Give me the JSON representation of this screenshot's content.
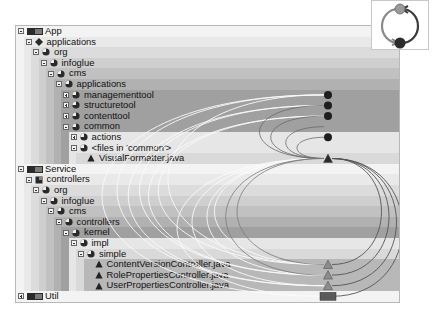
{
  "view": {
    "title": "Dependency structure view",
    "legend_icon": "cyclic-dependency-icon"
  },
  "tree": [
    {
      "label": "App",
      "depth": 0,
      "icon": "layer-icon",
      "toggle": "minus",
      "bg": "#f3f3f3"
    },
    {
      "label": "applications",
      "depth": 1,
      "icon": "module-icon",
      "toggle": "minus",
      "bg": "#e9e9e9"
    },
    {
      "label": "org",
      "depth": 2,
      "icon": "package-icon",
      "toggle": "minus",
      "bg": "#dcdcdc"
    },
    {
      "label": "infoglue",
      "depth": 3,
      "icon": "package-icon",
      "toggle": "minus",
      "bg": "#cfcfcf"
    },
    {
      "label": "cms",
      "depth": 4,
      "icon": "package-icon",
      "toggle": "minus",
      "bg": "#c1c1c1"
    },
    {
      "label": "applications",
      "depth": 5,
      "icon": "package-icon",
      "toggle": "minus",
      "bg": "#b1b1b1"
    },
    {
      "label": "managementtool",
      "depth": 6,
      "icon": "package-icon",
      "toggle": "plus",
      "bg": "#a0a0a0"
    },
    {
      "label": "structuretool",
      "depth": 6,
      "icon": "package-icon",
      "toggle": "plus",
      "bg": "#a0a0a0"
    },
    {
      "label": "contenttool",
      "depth": 6,
      "icon": "package-icon",
      "toggle": "plus",
      "bg": "#a0a0a0"
    },
    {
      "label": "common",
      "depth": 6,
      "icon": "package-icon",
      "toggle": "minus",
      "bg": "#a0a0a0"
    },
    {
      "label": "actions",
      "depth": 7,
      "icon": "package-icon",
      "toggle": "plus",
      "bg": "#e6e6e6"
    },
    {
      "label": "<files in 'common'>",
      "depth": 7,
      "icon": "package-icon",
      "toggle": "minus",
      "bg": "#e6e6e6"
    },
    {
      "label": "VisualFormatter.java",
      "depth": 8,
      "icon": "class-icon",
      "toggle": "none",
      "bg": "#d9d9d9"
    },
    {
      "label": "Service",
      "depth": 0,
      "icon": "layer-icon",
      "toggle": "minus",
      "bg": "#f3f3f3"
    },
    {
      "label": "controllers",
      "depth": 1,
      "icon": "module-icon",
      "toggle": "minus",
      "bg": "#e9e9e9"
    },
    {
      "label": "org",
      "depth": 2,
      "icon": "package-icon",
      "toggle": "minus",
      "bg": "#dcdcdc"
    },
    {
      "label": "infoglue",
      "depth": 3,
      "icon": "package-icon",
      "toggle": "minus",
      "bg": "#cfcfcf"
    },
    {
      "label": "cms",
      "depth": 4,
      "icon": "package-icon",
      "toggle": "minus",
      "bg": "#c1c1c1"
    },
    {
      "label": "controllers",
      "depth": 5,
      "icon": "package-icon",
      "toggle": "minus",
      "bg": "#b1b1b1"
    },
    {
      "label": "kernel",
      "depth": 6,
      "icon": "package-icon",
      "toggle": "minus",
      "bg": "#a0a0a0"
    },
    {
      "label": "impl",
      "depth": 7,
      "icon": "package-icon",
      "toggle": "minus",
      "bg": "#e6e6e6"
    },
    {
      "label": "simple",
      "depth": 8,
      "icon": "package-icon",
      "toggle": "minus",
      "bg": "#d9d9d9"
    },
    {
      "label": "ContentVersionController.java",
      "depth": 9,
      "icon": "class-icon",
      "toggle": "none",
      "bg": "#b8b8b8"
    },
    {
      "label": "RolePropertiesController.java",
      "depth": 9,
      "icon": "class-icon",
      "toggle": "none",
      "bg": "#b8b8b8"
    },
    {
      "label": "UserPropertiesController.java",
      "depth": 9,
      "icon": "class-icon",
      "toggle": "none",
      "bg": "#b8b8b8"
    },
    {
      "label": "Util",
      "depth": 0,
      "icon": "layer-icon",
      "toggle": "plus",
      "bg": "#f3f3f3"
    }
  ],
  "dependency_nodes": [
    {
      "row": 6,
      "type": "package"
    },
    {
      "row": 7,
      "type": "package"
    },
    {
      "row": 8,
      "type": "package"
    },
    {
      "row": 10,
      "type": "package"
    },
    {
      "row": 12,
      "type": "class"
    },
    {
      "row": 22,
      "type": "class"
    },
    {
      "row": 23,
      "type": "class"
    },
    {
      "row": 24,
      "type": "class"
    },
    {
      "row": 25,
      "type": "layer"
    }
  ]
}
